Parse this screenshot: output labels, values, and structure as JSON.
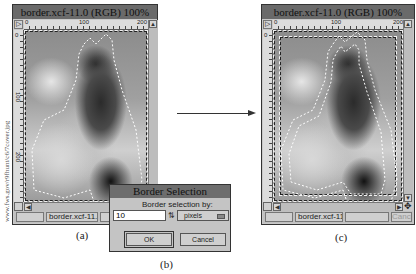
{
  "credit": "www.fws.gov/r9fhunt/c6/7cover.jpg",
  "window_a": {
    "title": "border.xcf-11.0 (RGB) 100%",
    "ruler_h_ticks": [
      "0",
      "100",
      "200"
    ],
    "ruler_v_ticks": [
      "0",
      "100",
      "200"
    ],
    "status_filename": "border.xcf-11.0",
    "caption": "(a)"
  },
  "dialog_b": {
    "title": "Border Selection",
    "label": "Border selection by:",
    "value": "10",
    "unit": "pixels",
    "ok_label": "OK",
    "cancel_label": "Cancel",
    "caption": "(b)"
  },
  "window_c": {
    "title": "border.xcf-11.0 (RGB) 100%",
    "ruler_h_ticks": [
      "0",
      "100",
      "200"
    ],
    "ruler_v_ticks": [
      "0"
    ],
    "status_filename": "border.xcf-11.0",
    "cancel_label": "Cancel",
    "caption": "(c)"
  }
}
